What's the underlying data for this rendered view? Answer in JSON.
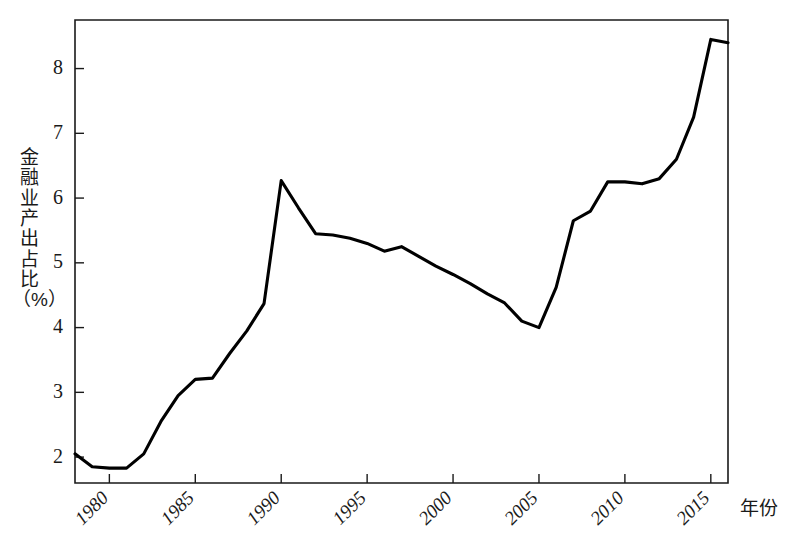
{
  "chart_data": {
    "type": "line",
    "title": "",
    "xlabel": "年份",
    "ylabel": "金融业产出占比（%）",
    "ylabel_chars": "金融业产出占比（%）",
    "xlim": [
      1978,
      2016
    ],
    "ylim": [
      1.6,
      8.75
    ],
    "grid": false,
    "legend": null,
    "xticks": [
      "1980",
      "1985",
      "1990",
      "1995",
      "2000",
      "2005",
      "2010",
      "2015"
    ],
    "xtick_values": [
      1980,
      1985,
      1990,
      1995,
      2000,
      2005,
      2010,
      2015
    ],
    "yticks": [
      "2",
      "3",
      "4",
      "5",
      "6",
      "7",
      "8"
    ],
    "ytick_values": [
      2,
      3,
      4,
      5,
      6,
      7,
      8
    ],
    "series": [
      {
        "name": "金融业产出占比",
        "color": "#000000",
        "x": [
          1978,
          1979,
          1980,
          1981,
          1982,
          1983,
          1984,
          1985,
          1986,
          1987,
          1988,
          1989,
          1990,
          1991,
          1992,
          1993,
          1994,
          1995,
          1996,
          1997,
          1998,
          1999,
          2000,
          2001,
          2002,
          2003,
          2004,
          2005,
          2006,
          2007,
          2008,
          2009,
          2010,
          2011,
          2012,
          2013,
          2014,
          2015,
          2016
        ],
        "values": [
          2.05,
          1.85,
          1.83,
          1.83,
          2.05,
          2.55,
          2.95,
          3.2,
          3.22,
          3.6,
          3.95,
          4.37,
          6.27,
          5.85,
          5.45,
          5.43,
          5.38,
          5.3,
          5.18,
          5.25,
          5.1,
          4.95,
          4.82,
          4.68,
          4.52,
          4.38,
          4.1,
          4.0,
          4.62,
          5.65,
          5.8,
          6.25,
          6.25,
          6.22,
          6.3,
          6.6,
          7.25,
          8.45,
          8.4
        ]
      }
    ]
  },
  "axis": {
    "x_title": "年份",
    "y_title": "金融业产出占比（%）"
  }
}
